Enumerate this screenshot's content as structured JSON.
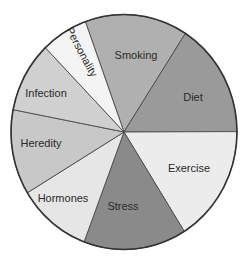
{
  "chart_data": {
    "type": "pie",
    "title": "",
    "start_angle_deg": 340,
    "direction": "clockwise",
    "categories": [
      "Smoking",
      "Diet",
      "Exercise",
      "Stress",
      "Hormones",
      "Heredity",
      "Infection",
      "Personality"
    ],
    "values": [
      14.7,
      15.8,
      16.1,
      14.7,
      10.6,
      11.7,
      9.7,
      6.7
    ],
    "slices": [
      {
        "label": "Smoking",
        "value": 14.7,
        "color": "#b0b0b0",
        "label_pos": [
          136,
          55
        ],
        "label_rotate": 0
      },
      {
        "label": "Diet",
        "value": 15.8,
        "color": "#9a9a9a",
        "label_pos": [
          193,
          97
        ],
        "label_rotate": 0
      },
      {
        "label": "Exercise",
        "value": 16.1,
        "color": "#ececec",
        "label_pos": [
          189,
          168
        ],
        "label_rotate": 0
      },
      {
        "label": "Stress",
        "value": 14.7,
        "color": "#8a8a8a",
        "label_pos": [
          123,
          206
        ],
        "label_rotate": 0
      },
      {
        "label": "Hormones",
        "value": 10.6,
        "color": "#e6e6e6",
        "label_pos": [
          63,
          198
        ],
        "label_rotate": 0
      },
      {
        "label": "Heredity",
        "value": 11.7,
        "color": "#c8c8c8",
        "label_pos": [
          41,
          143
        ],
        "label_rotate": 0
      },
      {
        "label": "Infection",
        "value": 9.7,
        "color": "#d0d0d0",
        "label_pos": [
          46,
          93
        ],
        "label_rotate": 0
      },
      {
        "label": "Personality",
        "value": 6.7,
        "color": "#f4f4f4",
        "label_pos": [
          82,
          52
        ],
        "label_rotate": 62
      }
    ],
    "geometry": {
      "cx": 124,
      "cy": 132,
      "rx": 113,
      "ry": 117.5
    },
    "legend": "none",
    "grid": false
  }
}
